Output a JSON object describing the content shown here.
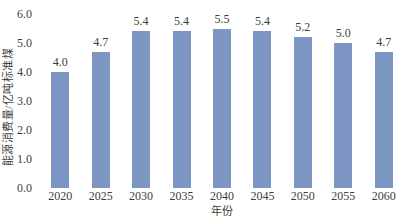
{
  "chart_data": {
    "type": "bar",
    "categories": [
      "2020",
      "2025",
      "2030",
      "2035",
      "2040",
      "2045",
      "2050",
      "2055",
      "2060"
    ],
    "values": [
      4.0,
      4.7,
      5.4,
      5.4,
      5.5,
      5.4,
      5.2,
      5.0,
      4.7
    ],
    "value_labels": [
      "4.0",
      "4.7",
      "5.4",
      "5.4",
      "5.5",
      "5.4",
      "5.2",
      "5.0",
      "4.7"
    ],
    "title": "",
    "xlabel": "年份",
    "ylabel": "能源消费量/亿吨标准煤",
    "ylim": [
      0.0,
      6.0
    ],
    "yticks": [
      "0.0",
      "1.0",
      "2.0",
      "3.0",
      "4.0",
      "5.0",
      "6.0"
    ],
    "ytick_values": [
      0,
      1,
      2,
      3,
      4,
      5,
      6
    ],
    "grid": "off",
    "legend": "none",
    "colors": {
      "bar_fill": "#7d96c4",
      "text": "#3d3d3d",
      "background": "#ffffff"
    }
  }
}
